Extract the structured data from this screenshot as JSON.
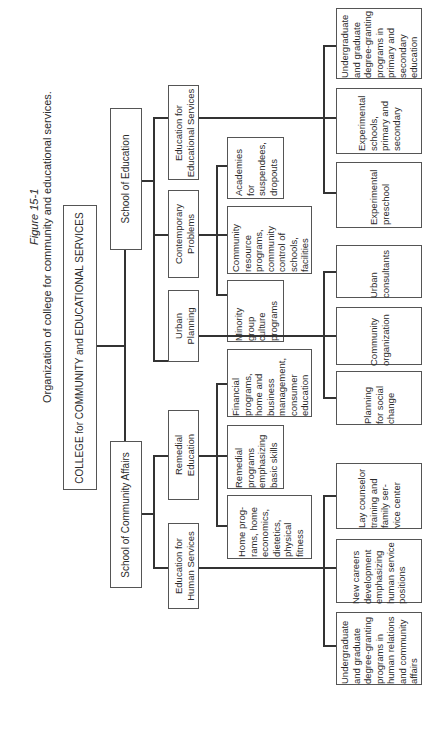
{
  "caption": {
    "figure_label": "Figure 15-1",
    "title": "Organization of college for community and educational services."
  },
  "root": {
    "label": "COLLEGE for COMMUNITY and EDUCATIONAL SERVICES"
  },
  "schools": [
    {
      "label": "School of Education"
    },
    {
      "label": "School of Community Affairs"
    }
  ],
  "divisions": [
    {
      "label": "Education for\nEducational Services"
    },
    {
      "label": "Contemporary\nProblems"
    },
    {
      "label": "Urban\nPlanning"
    },
    {
      "label": "Remedial\nEducation"
    },
    {
      "label": "Education for\nHuman Services"
    }
  ],
  "programs": {
    "contemporary_problems": [
      {
        "label": "Academies\nfor\nsuspendees,\ndropouts"
      },
      {
        "label": "Community\nresource\nprograms,\ncommunity\ncontrol of\nschools,\nfacilities"
      },
      {
        "label": "Minority\ngroup\nculture\nprograms"
      }
    ],
    "remedial_education": [
      {
        "label": "Financial\nprograms,\nhome and\nbusiness\nmanagement,\nconsumer\neducation"
      },
      {
        "label": "Remedial\nprograms\nemphasizing\nbasic skills"
      },
      {
        "label": "Home prog-\nrams, home\neconomics,\ndietetics,\nphysical\nfitness"
      }
    ],
    "educational_services": [
      {
        "label": "Undergraduate\nand graduate\ndegree-granting\nprograms in\nprimary and\nsecondary\neducation"
      },
      {
        "label": "Experimental\nschools,\nprimary and\nsecondary"
      },
      {
        "label": "Experimental\npreschool"
      }
    ],
    "urban_planning": [
      {
        "label": "Urban\nconsultants"
      },
      {
        "label": "Community\norganization"
      },
      {
        "label": "Planning\nfor social\nchange"
      }
    ],
    "human_services": [
      {
        "label": "Lay counselor\ntraining and\nfamily ser-\nvice center"
      },
      {
        "label": "New careers\ndevelopment\nemphasizing\nhuman service\npositions"
      },
      {
        "label": "Undergraduate\nand graduate\ndegree-granting\nprograms in\nhuman relations\nand community\naffairs"
      }
    ]
  }
}
